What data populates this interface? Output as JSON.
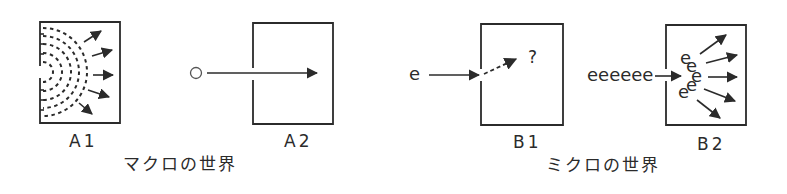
{
  "colors": {
    "ink": "#2b2b2b",
    "background": "#ffffff"
  },
  "macro": {
    "caption": "マクロの世界",
    "panels": [
      {
        "id": "A1",
        "label": "A1",
        "description": "wave passing through slit, spreading semicircular wavefronts with diverging arrows"
      },
      {
        "id": "A2",
        "label": "A2",
        "particle_symbol": "○",
        "description": "particle travels straight through slit"
      }
    ]
  },
  "micro": {
    "caption": "ミクロの世界",
    "panels": [
      {
        "id": "B1",
        "label": "B1",
        "particle_symbol": "e",
        "question_mark": "?",
        "description": "single electron through slit, unknown direction (dashed arrow)"
      },
      {
        "id": "B2",
        "label": "B2",
        "particle_stream": "eeeeee",
        "scattered": [
          "e",
          "e",
          "e",
          "e",
          "e"
        ],
        "description": "many electrons through slit, spreading like a wave"
      }
    ]
  },
  "icons": {
    "arrow": "arrow-icon",
    "particle": "circle-particle-icon",
    "wavefront": "wavefront-arc-icon"
  }
}
